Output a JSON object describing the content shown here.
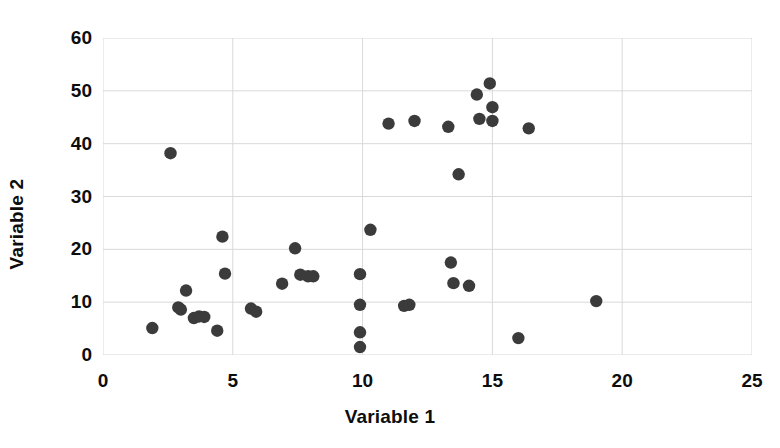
{
  "chart_data": {
    "type": "scatter",
    "title": "",
    "xlabel": "Variable 1",
    "ylabel": "Variable 2",
    "xlim": [
      0,
      25
    ],
    "ylim": [
      0,
      60
    ],
    "xticks": [
      0,
      5,
      10,
      15,
      20,
      25
    ],
    "yticks": [
      0,
      10,
      20,
      30,
      40,
      50,
      60
    ],
    "grid": true,
    "legend": false,
    "marker_color": "#3b3b3b",
    "marker_shape": "circle",
    "n_points": 42,
    "series": [
      {
        "name": "Variable 2 vs Variable 1",
        "points": [
          [
            1.9,
            5.1
          ],
          [
            2.6,
            38.2
          ],
          [
            2.9,
            9.0
          ],
          [
            3.0,
            8.6
          ],
          [
            3.2,
            12.2
          ],
          [
            3.5,
            7.0
          ],
          [
            3.7,
            7.3
          ],
          [
            3.9,
            7.2
          ],
          [
            4.4,
            4.6
          ],
          [
            4.6,
            22.4
          ],
          [
            4.7,
            15.4
          ],
          [
            5.7,
            8.8
          ],
          [
            5.9,
            8.2
          ],
          [
            6.9,
            13.5
          ],
          [
            7.4,
            20.2
          ],
          [
            7.6,
            15.2
          ],
          [
            7.9,
            14.9
          ],
          [
            8.1,
            14.9
          ],
          [
            9.9,
            1.5
          ],
          [
            9.9,
            4.3
          ],
          [
            9.9,
            9.5
          ],
          [
            9.9,
            15.3
          ],
          [
            10.3,
            23.7
          ],
          [
            11.0,
            43.8
          ],
          [
            11.6,
            9.3
          ],
          [
            11.8,
            9.5
          ],
          [
            12.0,
            44.3
          ],
          [
            13.3,
            43.2
          ],
          [
            13.4,
            17.5
          ],
          [
            13.5,
            13.6
          ],
          [
            13.7,
            34.2
          ],
          [
            14.1,
            13.1
          ],
          [
            14.4,
            49.3
          ],
          [
            14.5,
            44.7
          ],
          [
            14.9,
            51.4
          ],
          [
            15.0,
            46.9
          ],
          [
            15.0,
            44.3
          ],
          [
            16.0,
            3.2
          ],
          [
            16.4,
            42.9
          ],
          [
            19.0,
            10.2
          ]
        ]
      }
    ]
  },
  "axes": {
    "x_title": "Variable 1",
    "y_title": "Variable 2",
    "x_tick_labels": [
      "0",
      "5",
      "10",
      "15",
      "20",
      "25"
    ],
    "y_tick_labels": [
      "0",
      "10",
      "20",
      "30",
      "40",
      "50",
      "60"
    ]
  },
  "style": {
    "grid_color": "#d9d9d9",
    "text_color": "#0d0d0d",
    "background": "#ffffff"
  }
}
